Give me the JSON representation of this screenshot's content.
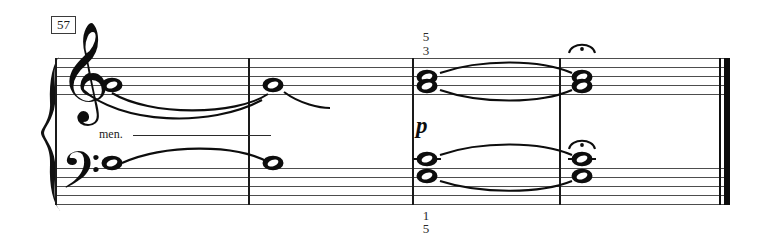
{
  "score": {
    "measure_number": "57",
    "staves": [
      {
        "name": "treble",
        "clef": "treble-clef",
        "clef_glyph": "𝄞"
      },
      {
        "name": "bass",
        "clef": "bass-clef",
        "clef_glyph": "𝄢"
      }
    ],
    "dynamics": [
      {
        "name": "piano",
        "text": "p"
      }
    ],
    "directions": [
      {
        "name": "morendo-continuation",
        "text": "men."
      }
    ],
    "fingerings": {
      "treble_above": {
        "upper": "5",
        "lower": "3"
      },
      "bass_below": {
        "upper": "1",
        "lower": "5"
      }
    },
    "articulations": [
      {
        "name": "fermata-treble",
        "glyph": "·"
      },
      {
        "name": "fermata-bass",
        "glyph": "·"
      }
    ],
    "barlines": [
      {
        "name": "barline-1",
        "type": "single"
      },
      {
        "name": "barline-2",
        "type": "single"
      },
      {
        "name": "barline-3",
        "type": "single"
      },
      {
        "name": "barline-final",
        "type": "final"
      }
    ],
    "notes": {
      "treble": [
        {
          "name": "note-treble-m1",
          "duration": "whole",
          "tied": true
        },
        {
          "name": "note-treble-m2",
          "duration": "whole",
          "tied": true
        },
        {
          "name": "note-treble-m3-upper",
          "duration": "whole",
          "tied": true
        },
        {
          "name": "note-treble-m3-lower",
          "duration": "whole",
          "tied": true
        },
        {
          "name": "note-treble-m4-upper",
          "duration": "whole",
          "fermata": true
        },
        {
          "name": "note-treble-m4-lower",
          "duration": "whole",
          "fermata": true
        }
      ],
      "bass": [
        {
          "name": "note-bass-m1",
          "duration": "whole",
          "tied": true
        },
        {
          "name": "note-bass-m2",
          "duration": "whole",
          "tied": true
        },
        {
          "name": "note-bass-m3-upper",
          "duration": "whole",
          "tied": true
        },
        {
          "name": "note-bass-m3-lower",
          "duration": "whole",
          "tied": true
        },
        {
          "name": "note-bass-m4-upper",
          "duration": "whole",
          "fermata": true
        },
        {
          "name": "note-bass-m4-lower",
          "duration": "whole",
          "fermata": true
        }
      ]
    },
    "colors": {
      "ink": "#0d0d0d",
      "staff": "#4d4d4d",
      "paper": "#ffffff"
    }
  }
}
